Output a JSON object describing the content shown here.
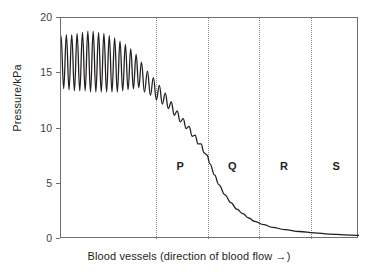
{
  "chart_data": {
    "type": "line",
    "title": "",
    "xlabel": "Blood vessels (direction of blood flow →)",
    "ylabel": "Pressure/kPa",
    "ylim": [
      0,
      20
    ],
    "yticks": [
      0,
      5,
      10,
      15,
      20
    ],
    "ytick_labels": [
      "0",
      "5",
      "10",
      "15",
      "20"
    ],
    "xticks": [],
    "xtick_labels": [],
    "grid": false,
    "legend": "none",
    "series": [
      {
        "name": "Blood pressure along vessels",
        "description": "Pulsatile pressure oscillating between about 13.5 and 18.5 kPa in the arteries, damping progressively to a smooth falling curve that drops steeply through region P and decays asymptotically towards 0 kPa across regions Q, R and S.",
        "points": [
          [
            0.0,
            18.4
          ],
          [
            0.9,
            13.6
          ],
          [
            1.8,
            18.5
          ],
          [
            2.7,
            13.5
          ],
          [
            3.6,
            18.5
          ],
          [
            4.5,
            13.4
          ],
          [
            5.4,
            18.6
          ],
          [
            6.3,
            13.4
          ],
          [
            7.2,
            18.7
          ],
          [
            8.1,
            13.4
          ],
          [
            9.0,
            18.8
          ],
          [
            9.9,
            13.3
          ],
          [
            10.8,
            18.8
          ],
          [
            11.7,
            13.3
          ],
          [
            12.6,
            18.7
          ],
          [
            13.5,
            13.3
          ],
          [
            14.4,
            18.6
          ],
          [
            15.3,
            13.3
          ],
          [
            16.2,
            18.4
          ],
          [
            17.1,
            13.3
          ],
          [
            18.0,
            18.2
          ],
          [
            18.9,
            13.3
          ],
          [
            19.8,
            17.9
          ],
          [
            20.7,
            13.4
          ],
          [
            21.6,
            17.6
          ],
          [
            22.5,
            13.5
          ],
          [
            23.4,
            17.2
          ],
          [
            24.3,
            13.6
          ],
          [
            25.2,
            16.7
          ],
          [
            26.1,
            13.7
          ],
          [
            27.0,
            16.0
          ],
          [
            28.0,
            13.3
          ],
          [
            29.0,
            15.2
          ],
          [
            30.0,
            13.0
          ],
          [
            31.0,
            14.6
          ],
          [
            32.0,
            12.6
          ],
          [
            33.0,
            13.9
          ],
          [
            34.0,
            12.2
          ],
          [
            35.0,
            13.2
          ],
          [
            36.0,
            11.8
          ],
          [
            37.0,
            12.4
          ],
          [
            38.0,
            11.2
          ],
          [
            39.0,
            11.6
          ],
          [
            40.0,
            10.6
          ],
          [
            41.0,
            10.9
          ],
          [
            42.0,
            10.0
          ],
          [
            43.0,
            10.2
          ],
          [
            44.0,
            9.3
          ],
          [
            45.0,
            9.4
          ],
          [
            46.0,
            8.6
          ],
          [
            47.0,
            8.6
          ],
          [
            48.0,
            7.8
          ],
          [
            49.0,
            7.6
          ],
          [
            50.0,
            6.8
          ],
          [
            51.5,
            5.8
          ],
          [
            53.0,
            4.9
          ],
          [
            55.0,
            4.0
          ],
          [
            57.0,
            3.3
          ],
          [
            59.0,
            2.7
          ],
          [
            61.0,
            2.3
          ],
          [
            63.0,
            1.9
          ],
          [
            65.0,
            1.6
          ],
          [
            68.0,
            1.3
          ],
          [
            71.0,
            1.05
          ],
          [
            75.0,
            0.85
          ],
          [
            80.0,
            0.68
          ],
          [
            85.0,
            0.55
          ],
          [
            90.0,
            0.45
          ],
          [
            95.0,
            0.38
          ],
          [
            100.0,
            0.32
          ]
        ]
      }
    ],
    "regions": [
      {
        "label": "P",
        "x_fraction": 0.4
      },
      {
        "label": "Q",
        "x_fraction": 0.575
      },
      {
        "label": "R",
        "x_fraction": 0.748
      },
      {
        "label": "S",
        "x_fraction": 0.923
      }
    ],
    "dividers": [
      0.319,
      0.493,
      0.664,
      0.839
    ]
  },
  "axis": {
    "y_title": "Pressure/kPa",
    "x_title": "Blood vessels (direction of blood flow →)",
    "y_labels": [
      "20",
      "15",
      "10",
      "5",
      "0"
    ]
  },
  "colors": {
    "curve": "#231f20",
    "frame": "#6d6e70",
    "divider": "#8c8c8c",
    "text": "#231f20",
    "background": "#ffffff"
  }
}
